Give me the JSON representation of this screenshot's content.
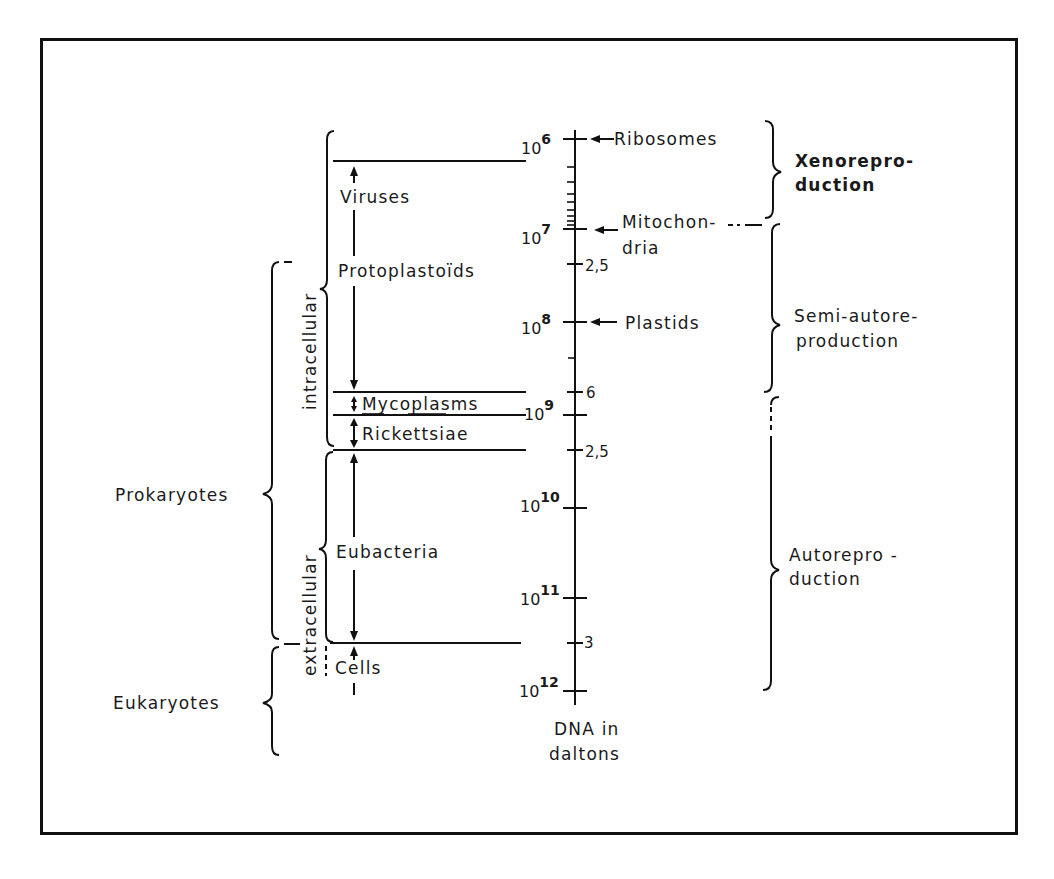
{
  "diagram": {
    "axis": {
      "caption_line1": "DNA in",
      "caption_line2": "daltons",
      "major_ticks": [
        {
          "base": "10",
          "exp": "6",
          "y": 139
        },
        {
          "base": "10",
          "exp": "7",
          "y": 229
        },
        {
          "base": "10",
          "exp": "8",
          "y": 322
        },
        {
          "base": "10",
          "exp": "9",
          "y": 415
        },
        {
          "base": "10",
          "exp": "10",
          "y": 508
        },
        {
          "base": "10",
          "exp": "11",
          "y": 598
        },
        {
          "base": "10",
          "exp": "12",
          "y": 691
        }
      ],
      "minor_labels": [
        {
          "text": "2,5",
          "y": 265
        },
        {
          "text": "6",
          "y": 392
        },
        {
          "text": "2,5",
          "y": 450
        },
        {
          "text": "3",
          "y": 643
        }
      ]
    },
    "organelles": [
      {
        "label": "Ribosomes",
        "y": 139
      },
      {
        "label": "Mitochon-",
        "label2": "dria",
        "y": 229
      },
      {
        "label": "Plastids",
        "y": 322
      }
    ],
    "groups": [
      {
        "label": "Viruses"
      },
      {
        "label": "Protoplastoïds"
      },
      {
        "label": "Mycoplasms"
      },
      {
        "label": "Rickettsiae"
      },
      {
        "label": "Eubacteria"
      },
      {
        "label": "Cells"
      }
    ],
    "habitat": {
      "intracellular": "intracellular",
      "extracellular": "extracellular"
    },
    "domains": {
      "prokaryotes": "Prokaryotes",
      "eukaryotes": "Eukaryotes"
    },
    "reproduction": {
      "xeno_line1": "Xenorepro-",
      "xeno_line2": "duction",
      "semi_line1": "Semi-autore-",
      "semi_line2": "production",
      "auto_line1": "Autorepro -",
      "auto_line2": "duction"
    }
  }
}
